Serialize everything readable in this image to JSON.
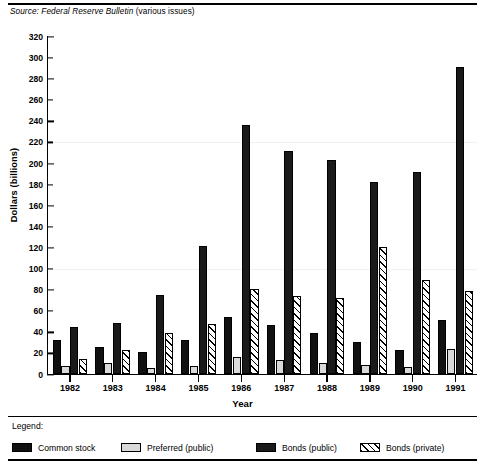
{
  "source_note": {
    "prefix": "Source:",
    "italic_part": "Federal Reserve Bulletin",
    "suffix": "(various issues)",
    "full": "Source: Federal Reserve Bulletin (various issues)"
  },
  "legend": {
    "title": "Legend:",
    "items": [
      {
        "label": "Common stock",
        "pattern": "solid-black",
        "color": "#111111"
      },
      {
        "label": "Preferred (public)",
        "pattern": "light-gray",
        "color": "#d9d9d9"
      },
      {
        "label": "Bonds (public)",
        "pattern": "solid-black",
        "color": "#1a1a1a"
      },
      {
        "label": "Bonds (private)",
        "pattern": "diagonal-hatch",
        "color": "#ffffff"
      }
    ]
  },
  "chart_data": {
    "type": "bar",
    "title": "",
    "xlabel": "Year",
    "ylabel": "Dollars (billions)",
    "ylim": [
      0,
      320
    ],
    "ytick_step": 20,
    "yticks": [
      0,
      20,
      40,
      60,
      80,
      100,
      120,
      140,
      160,
      180,
      200,
      220,
      240,
      260,
      280,
      300,
      320
    ],
    "grid": false,
    "legend_position": "bottom",
    "categories": [
      "1982",
      "1983",
      "1984",
      "1985",
      "1986",
      "1987",
      "1988",
      "1989",
      "1990",
      "1991"
    ],
    "series": [
      {
        "name": "Common stock",
        "values": [
          32,
          26,
          21,
          32,
          54,
          46,
          39,
          30,
          23,
          51
        ]
      },
      {
        "name": "Preferred (public)",
        "values": [
          8,
          10,
          6,
          8,
          16,
          13,
          10,
          9,
          7,
          24
        ]
      },
      {
        "name": "Bonds (public)",
        "values": [
          45,
          48,
          75,
          121,
          236,
          211,
          203,
          182,
          192,
          291
        ]
      },
      {
        "name": "Bonds (private)",
        "values": [
          14,
          23,
          39,
          47,
          81,
          74,
          72,
          120,
          89,
          79
        ]
      }
    ]
  }
}
